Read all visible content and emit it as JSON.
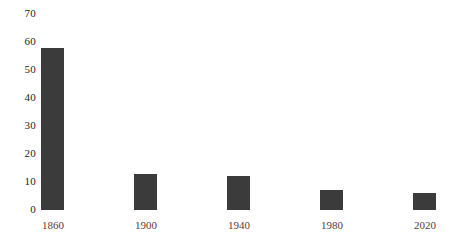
{
  "chart_data": {
    "type": "bar",
    "title": "",
    "subtitle": "",
    "xlabel": "",
    "ylabel": "",
    "categories": [
      "1860",
      "1900",
      "1940",
      "1980",
      "2020"
    ],
    "values": [
      58,
      13,
      12,
      7,
      6
    ],
    "series": [
      {
        "name": "",
        "values": [
          58,
          13,
          12,
          7,
          6
        ]
      }
    ],
    "ylim": [
      0,
      70
    ],
    "ytick_labels": [
      "0",
      "10",
      "20",
      "30",
      "40",
      "50",
      "60",
      "70"
    ],
    "ytick_values": [
      0,
      10,
      20,
      30,
      40,
      50,
      60,
      70
    ],
    "grid": false,
    "legend": null,
    "legend_position": "none",
    "annotations": [],
    "bar_color": "#3b3b3b",
    "xtick_label_color": "#5e3a35",
    "ytick_label_color": "#1d1d1d",
    "background_color": "#ffffff"
  }
}
